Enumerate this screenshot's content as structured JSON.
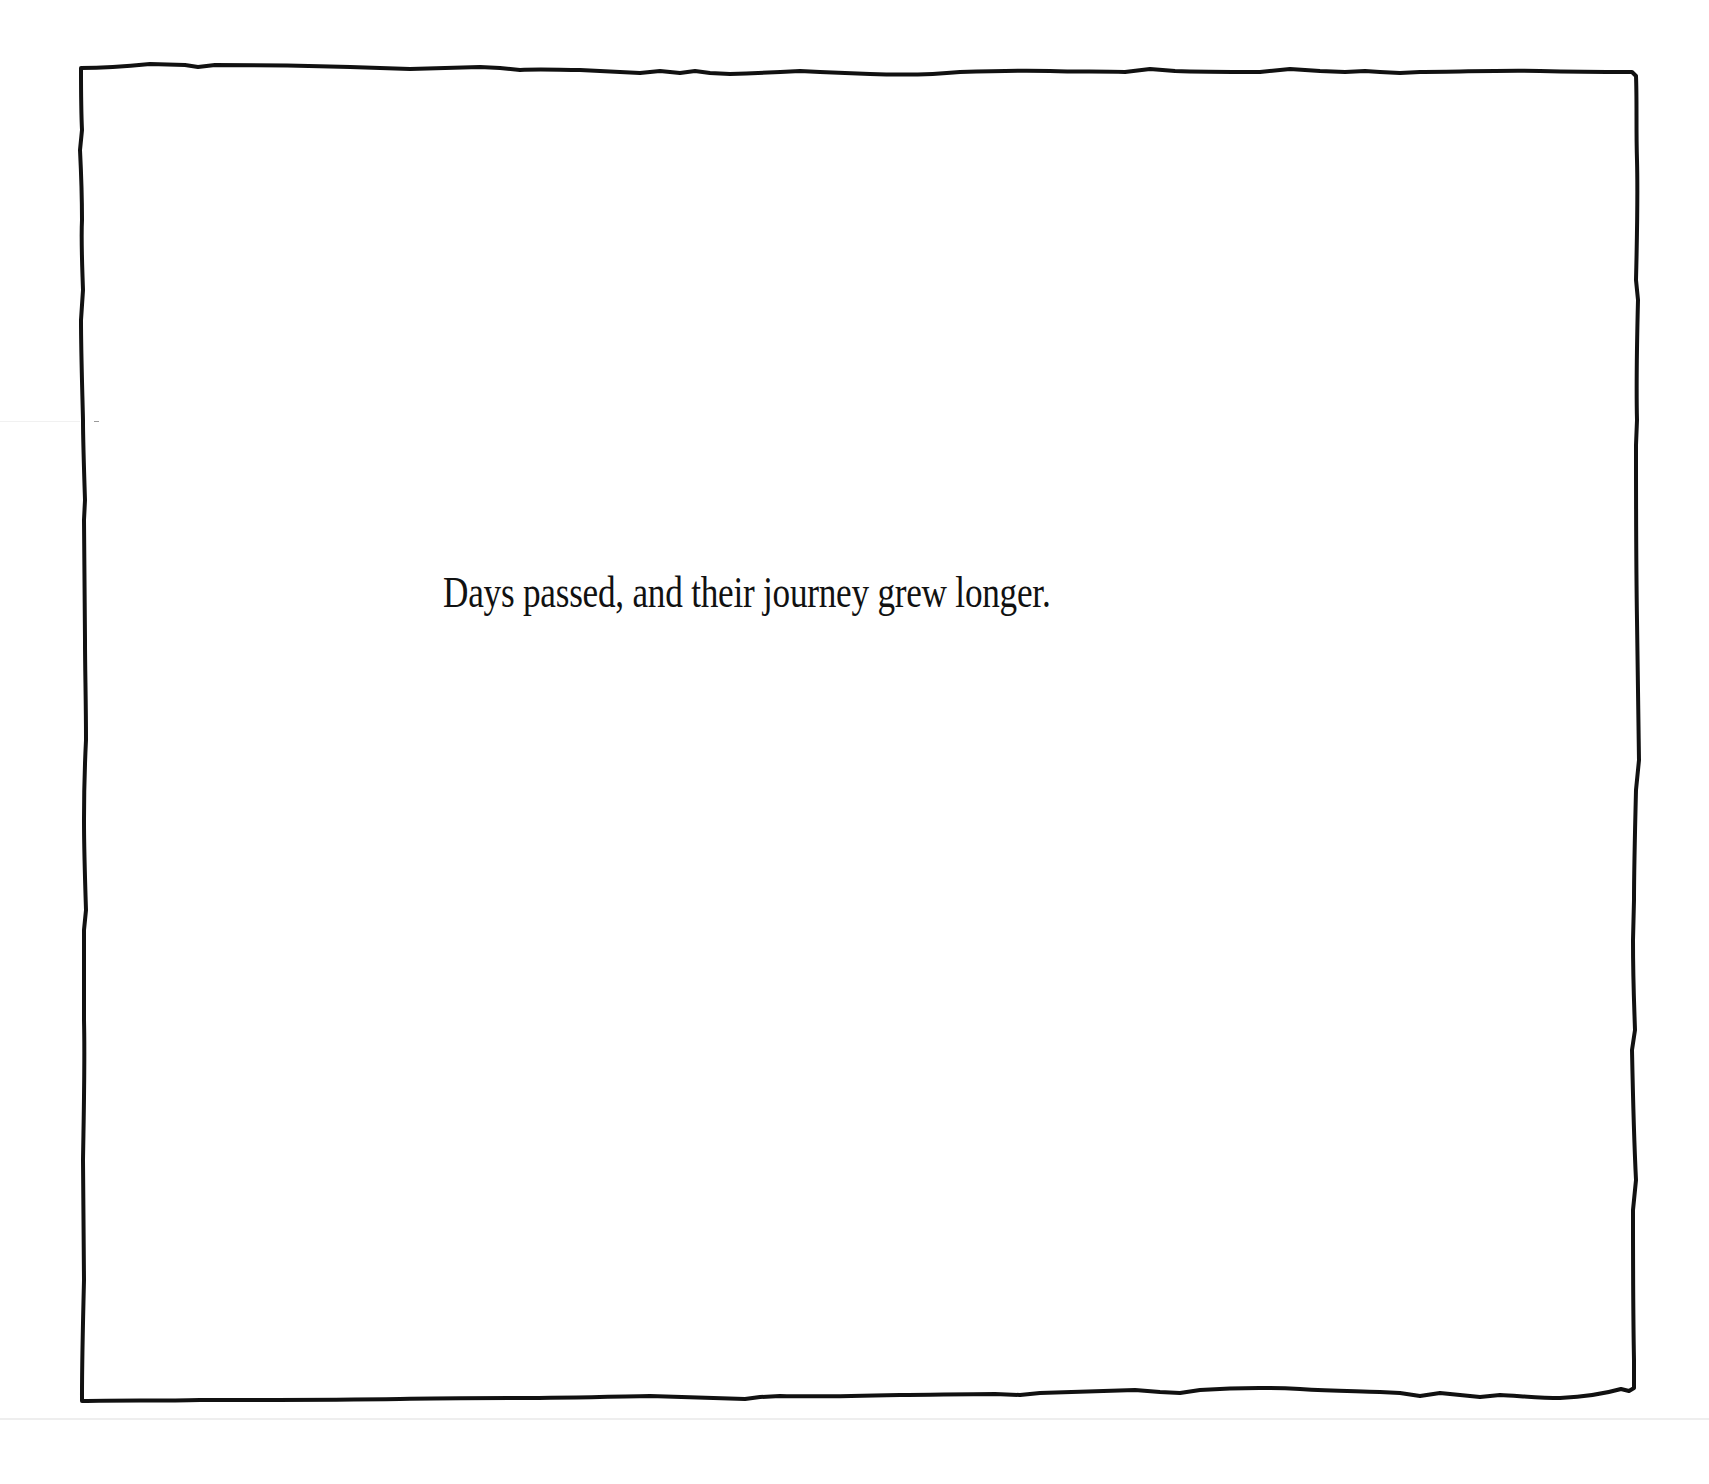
{
  "page": {
    "background_color": "#ffffff",
    "frame": {
      "style": "hand-drawn",
      "stroke_color": "#111111"
    },
    "caption": {
      "text": "Days passed, and their journey grew longer.",
      "color": "#111111"
    }
  }
}
